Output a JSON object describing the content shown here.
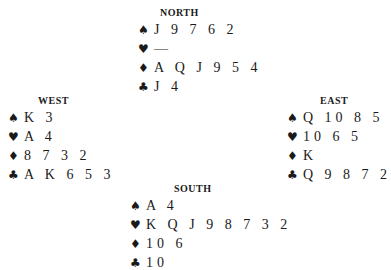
{
  "suits": {
    "spades": "♠",
    "hearts": "♥",
    "diamonds": "♦",
    "clubs": "♣"
  },
  "hands": {
    "north": {
      "label": "NORTH",
      "spades": "J 9 7 6 2",
      "hearts": "—",
      "diamonds": "A Q J 9 5 4",
      "clubs": "J 4"
    },
    "west": {
      "label": "WEST",
      "spades": "K 3",
      "hearts": "A 4",
      "diamonds": "8 7 3 2",
      "clubs": "A K 6 5 3"
    },
    "east": {
      "label": "EAST",
      "spades": "Q 10 8 5",
      "hearts": "10 6 5",
      "diamonds": "K",
      "clubs": "Q 9 8 7 2"
    },
    "south": {
      "label": "SOUTH",
      "spades": "A 4",
      "hearts": "K Q J 9 8 7 3 2",
      "diamonds": "10 6",
      "clubs": "10"
    }
  }
}
